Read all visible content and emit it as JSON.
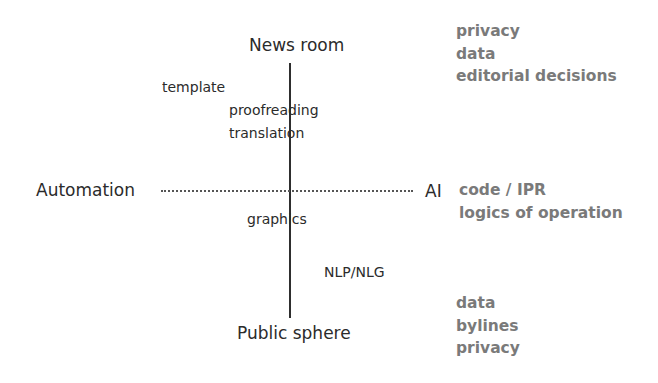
{
  "diagram": {
    "axes": {
      "top": "News room",
      "bottom": "Public sphere",
      "left": "Automation",
      "right": "AI"
    },
    "items": {
      "template": "template",
      "proofreading": "proofreading",
      "translation": "translation",
      "graphics": "graphics",
      "nlp_nlg": "NLP/NLG"
    },
    "issues": {
      "top": [
        "privacy",
        "data",
        "editorial decisions"
      ],
      "right": [
        "code / IPR",
        "logics of operation"
      ],
      "bottom": [
        "data",
        "bylines",
        "privacy"
      ]
    },
    "colors": {
      "axis_text": "#2b2b2b",
      "issue_text": "#7a7a7a",
      "line": "#2e2e2e"
    }
  }
}
